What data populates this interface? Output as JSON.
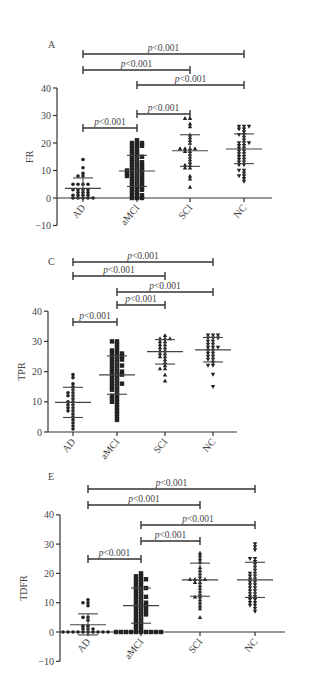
{
  "figure": {
    "panels": [
      "A",
      "C",
      "E"
    ]
  },
  "chart_data": [
    {
      "panel_label": "A",
      "type": "scatter",
      "title": "",
      "xlabel": "",
      "ylabel": "FR",
      "categories": [
        "AD",
        "aMCI",
        "SCI",
        "NC"
      ],
      "markers": [
        "circle",
        "square",
        "triangle-up",
        "triangle-down"
      ],
      "ylim": [
        -10,
        40
      ],
      "yticks": [
        -10,
        0,
        10,
        20,
        30,
        40
      ],
      "grid": false,
      "summary": [
        {
          "group": "AD",
          "mean": 3.5,
          "sd_low": 0,
          "sd_high": 7.3
        },
        {
          "group": "aMCI",
          "mean": 9.8,
          "sd_low": 4.2,
          "sd_high": 15.5
        },
        {
          "group": "SCI",
          "mean": 17.2,
          "sd_low": 11.5,
          "sd_high": 23
        },
        {
          "group": "NC",
          "mean": 17.8,
          "sd_low": 12.5,
          "sd_high": 23.3
        }
      ],
      "points": {
        "AD": [
          14,
          11,
          9,
          8,
          8,
          5,
          5,
          5,
          5,
          3,
          3,
          3,
          3,
          2,
          2,
          2,
          1,
          1,
          1,
          1,
          0,
          0,
          0,
          0,
          0
        ],
        "aMCI": [
          21,
          20,
          20,
          20,
          19,
          19,
          19,
          18,
          18,
          17,
          17,
          16,
          16,
          15,
          15,
          15,
          14,
          14,
          13,
          13,
          13,
          12,
          12,
          12,
          11,
          11,
          11,
          10,
          10,
          10,
          10,
          9,
          9,
          9,
          9,
          8,
          8,
          8,
          8,
          7,
          7,
          7,
          6,
          6,
          6,
          5,
          5,
          5,
          4,
          4,
          4,
          3,
          3,
          3,
          2,
          2,
          1,
          1,
          1,
          0,
          0,
          0
        ],
        "SCI": [
          29,
          29,
          27,
          26,
          23,
          22,
          21,
          20,
          18,
          18,
          18,
          18,
          17,
          17,
          16,
          15,
          14,
          13,
          12,
          12,
          11,
          11,
          8,
          7,
          4
        ],
        "NC": [
          26,
          26,
          26,
          25,
          25,
          24,
          23,
          23,
          22,
          21,
          20,
          20,
          20,
          19,
          19,
          18,
          18,
          17,
          17,
          16,
          16,
          15,
          15,
          14,
          14,
          13,
          13,
          12,
          12,
          10,
          10,
          9,
          8,
          8,
          7,
          6
        ]
      },
      "comparisons": [
        {
          "from": "AD",
          "to": "aMCI",
          "label": "p<0.001"
        },
        {
          "from": "aMCI",
          "to": "SCI",
          "label": "p<0.001"
        },
        {
          "from": "aMCI",
          "to": "NC",
          "label": "p<0.001"
        },
        {
          "from": "AD",
          "to": "SCI",
          "label": "p<0.001"
        },
        {
          "from": "AD",
          "to": "NC",
          "label": "p<0.001"
        }
      ]
    },
    {
      "panel_label": "C",
      "type": "scatter",
      "title": "",
      "xlabel": "",
      "ylabel": "TPR",
      "categories": [
        "AD",
        "aMCI",
        "SCI",
        "NC"
      ],
      "markers": [
        "circle",
        "square",
        "triangle-up",
        "triangle-down"
      ],
      "ylim": [
        0,
        40
      ],
      "yticks": [
        0,
        10,
        20,
        30,
        40
      ],
      "grid": false,
      "summary": [
        {
          "group": "AD",
          "mean": 9.8,
          "sd_low": 4.8,
          "sd_high": 14.8
        },
        {
          "group": "aMCI",
          "mean": 18.9,
          "sd_low": 12.5,
          "sd_high": 25.2
        },
        {
          "group": "SCI",
          "mean": 26.6,
          "sd_low": 22.5,
          "sd_high": 30.6
        },
        {
          "group": "NC",
          "mean": 27.2,
          "sd_low": 23.2,
          "sd_high": 31.3
        }
      ],
      "points": {
        "AD": [
          19,
          18,
          16,
          15,
          14,
          13,
          13,
          12,
          12,
          11,
          10,
          10,
          9,
          9,
          8,
          8,
          7,
          7,
          6,
          5,
          4,
          3,
          2,
          1
        ],
        "aMCI": [
          30,
          30,
          29,
          28,
          27,
          27,
          26,
          26,
          26,
          25,
          25,
          25,
          24,
          24,
          24,
          23,
          23,
          22,
          22,
          22,
          21,
          21,
          20,
          20,
          20,
          19,
          19,
          19,
          18,
          18,
          17,
          17,
          16,
          16,
          16,
          15,
          15,
          14,
          14,
          13,
          12,
          12,
          11,
          11,
          10,
          10,
          9,
          8,
          7,
          6,
          5,
          4
        ],
        "SCI": [
          32,
          31,
          31,
          31,
          30,
          30,
          29,
          29,
          28,
          28,
          27,
          27,
          26,
          26,
          25,
          25,
          24,
          23,
          22,
          21,
          21,
          19,
          17
        ],
        "NC": [
          32,
          32,
          32,
          31,
          31,
          31,
          30,
          30,
          29,
          29,
          28,
          28,
          28,
          27,
          27,
          26,
          26,
          25,
          25,
          24,
          24,
          23,
          22,
          22,
          19,
          15
        ]
      },
      "comparisons": [
        {
          "from": "AD",
          "to": "aMCI",
          "label": "p<0.001"
        },
        {
          "from": "aMCI",
          "to": "SCI",
          "label": "p<0.001"
        },
        {
          "from": "aMCI",
          "to": "NC",
          "label": "p<0.001"
        },
        {
          "from": "AD",
          "to": "SCI",
          "label": "p<0.001"
        },
        {
          "from": "AD",
          "to": "NC",
          "label": "p<0.001"
        }
      ]
    },
    {
      "panel_label": "E",
      "type": "scatter",
      "title": "",
      "xlabel": "",
      "ylabel": "TDFR",
      "categories": [
        "AD",
        "aMCI",
        "SCI",
        "NC"
      ],
      "markers": [
        "circle",
        "square",
        "triangle-up",
        "triangle-down"
      ],
      "ylim": [
        -10,
        40
      ],
      "yticks": [
        -10,
        0,
        10,
        20,
        30,
        40
      ],
      "grid": false,
      "summary": [
        {
          "group": "AD",
          "mean": 2.5,
          "sd_low": -1,
          "sd_high": 6.2
        },
        {
          "group": "aMCI",
          "mean": 9,
          "sd_low": 3,
          "sd_high": 15
        },
        {
          "group": "SCI",
          "mean": 17.8,
          "sd_low": 12.2,
          "sd_high": 23.5
        },
        {
          "group": "NC",
          "mean": 17.8,
          "sd_low": 11.8,
          "sd_high": 23.8
        }
      ],
      "points": {
        "AD": [
          11,
          10,
          10,
          9,
          5,
          5,
          4,
          2,
          2,
          1,
          1,
          1,
          0,
          0,
          0,
          0,
          0,
          0,
          0,
          0,
          0,
          0
        ],
        "aMCI": [
          20,
          19,
          19,
          18,
          18,
          18,
          17,
          17,
          16,
          16,
          15,
          15,
          15,
          14,
          14,
          13,
          13,
          12,
          12,
          12,
          11,
          11,
          10,
          10,
          10,
          9,
          9,
          9,
          8,
          8,
          8,
          7,
          7,
          7,
          6,
          6,
          6,
          5,
          5,
          4,
          4,
          3,
          3,
          2,
          2,
          1,
          1,
          0,
          0,
          0,
          0,
          0,
          0,
          0,
          0,
          0,
          0
        ],
        "SCI": [
          27,
          26,
          25,
          24,
          22,
          21,
          20,
          19,
          18,
          18,
          18,
          18,
          17,
          17,
          16,
          15,
          14,
          13,
          12,
          12,
          11,
          10,
          9,
          8,
          5
        ],
        "NC": [
          30,
          29,
          28,
          25,
          25,
          24,
          23,
          22,
          21,
          20,
          20,
          19,
          19,
          18,
          18,
          17,
          17,
          16,
          16,
          15,
          15,
          14,
          14,
          13,
          13,
          12,
          12,
          11,
          11,
          10,
          10,
          9,
          9,
          8,
          7
        ]
      },
      "comparisons": [
        {
          "from": "AD",
          "to": "aMCI",
          "label": "p<0.001"
        },
        {
          "from": "aMCI",
          "to": "SCI",
          "label": "p<0.001"
        },
        {
          "from": "aMCI",
          "to": "NC",
          "label": "p<0.001"
        },
        {
          "from": "AD",
          "to": "SCI",
          "label": "p<0.001"
        },
        {
          "from": "AD",
          "to": "NC",
          "label": "p<0.001"
        }
      ]
    }
  ],
  "layout": {
    "panels": [
      {
        "label_pos": [
          48,
          48
        ],
        "axis_x": 57,
        "y_top": 88,
        "y_zero": 198,
        "px_per_unit": 2.75,
        "x_end": 272,
        "cat_x": [
          83,
          137,
          190,
          244
        ],
        "sig_y": [
          128,
          114,
          85,
          70,
          54
        ],
        "tick_label_size": 10,
        "ylabel_x": 33
      },
      {
        "label_pos": [
          48,
          265
        ],
        "axis_x": 48,
        "y_top": 311,
        "y_zero": 432,
        "px_per_unit": 3.02,
        "x_end": 237,
        "cat_x": [
          73,
          117,
          165,
          213
        ],
        "sig_y": [
          322,
          305,
          292,
          276,
          262
        ],
        "tick_label_size": 10,
        "ylabel_x": 25
      },
      {
        "label_pos": [
          48,
          480
        ],
        "axis_x": 60,
        "y_top": 515,
        "y_zero": 632,
        "px_per_unit": 2.93,
        "x_end": 285,
        "cat_x": [
          88,
          141,
          200,
          255
        ],
        "sig_y": [
          559,
          541,
          525,
          505,
          489
        ],
        "tick_label_size": 10,
        "ylabel_x": 27
      }
    ]
  }
}
